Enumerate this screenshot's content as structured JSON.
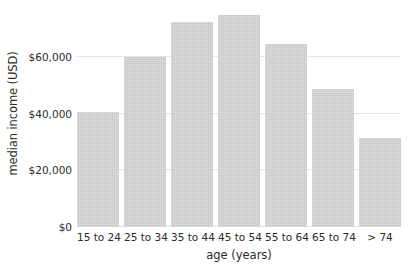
{
  "chart_data": {
    "type": "bar",
    "title": "",
    "subtitle": "",
    "xlabel": "age (years)",
    "ylabel": "median income (USD)",
    "categories": [
      "15 to 24",
      "25 to 34",
      "35 to 44",
      "45 to 54",
      "55 to 64",
      "65 to 74",
      "> 74"
    ],
    "values": [
      40500,
      60000,
      72500,
      75000,
      64500,
      48800,
      31500
    ],
    "ylim": [
      0,
      77000
    ],
    "ytick_values": [
      0,
      20000,
      40000,
      60000
    ],
    "ytick_labels": [
      "$0",
      "$20,000",
      "$40,000",
      "$60,000"
    ],
    "grid": "horizontal",
    "legend": "none",
    "bar_color": "#d2d2d2",
    "grid_color": "#e4e4e4",
    "text_color": "#2b2b2b",
    "background": "#ffffff"
  }
}
